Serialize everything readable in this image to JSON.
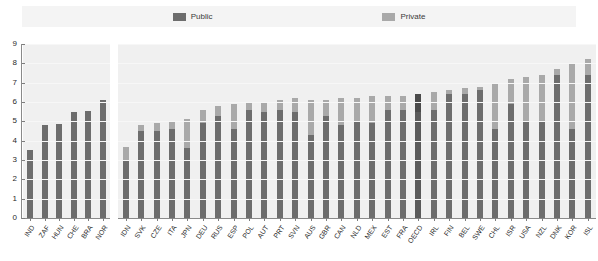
{
  "legend": {
    "entries": [
      {
        "label": "Public",
        "color": "#6d6d6d",
        "icon": "legend-swatch-icon"
      },
      {
        "label": "Private",
        "color": "#a9a9a9",
        "icon": "legend-swatch-icon"
      }
    ]
  },
  "chart_data": {
    "type": "bar",
    "title": "",
    "subtitle": "",
    "xlabel": "",
    "ylabel": "",
    "ylim": [
      0,
      9
    ],
    "yticks": [
      0,
      1,
      2,
      3,
      4,
      5,
      6,
      7,
      8,
      9
    ],
    "ytick_labels": [
      "0",
      "1",
      "2",
      "3",
      "4",
      "5",
      "6",
      "7",
      "8",
      "9"
    ],
    "grid": true,
    "stacked": true,
    "legend_position": "top",
    "legend_entries": [
      "Public",
      "Private"
    ],
    "series": [
      {
        "name": "Public",
        "color": "#6d6d6d"
      },
      {
        "name": "Private",
        "color": "#a9a9a9"
      }
    ],
    "panels": [
      {
        "name": "left-panel",
        "categories": [
          "IND",
          "ZAF",
          "HUN",
          "CHE",
          "BRA",
          "NOR"
        ],
        "public": [
          3.5,
          4.8,
          4.85,
          5.5,
          5.55,
          6.1
        ],
        "private": [
          0.0,
          0.0,
          0.0,
          0.0,
          0.0,
          0.0
        ],
        "totals": [
          3.5,
          4.8,
          4.85,
          5.5,
          5.55,
          6.1
        ],
        "highlight": []
      },
      {
        "name": "right-panel",
        "categories": [
          "IDN",
          "SVK",
          "CZE",
          "ITA",
          "JPN",
          "DEU",
          "RUS",
          "ESP",
          "POL",
          "AUT",
          "PRT",
          "SVN",
          "AUS",
          "GBR",
          "CAN",
          "NLD",
          "MEX",
          "EST",
          "FRA",
          "OECD",
          "IRL",
          "FIN",
          "BEL",
          "SWE",
          "CHL",
          "ISR",
          "USA",
          "NZL",
          "DNK",
          "KOR",
          "ISL"
        ],
        "public": [
          3.0,
          4.5,
          4.5,
          4.6,
          3.6,
          4.9,
          5.3,
          4.6,
          5.6,
          5.5,
          5.6,
          5.5,
          4.3,
          5.3,
          4.8,
          5.0,
          4.9,
          5.6,
          5.6,
          5.5,
          5.6,
          6.4,
          6.4,
          6.6,
          4.6,
          5.9,
          5.0,
          5.0,
          7.4,
          4.6,
          7.4
        ],
        "private": [
          0.65,
          0.3,
          0.4,
          0.4,
          1.5,
          0.7,
          0.5,
          1.3,
          0.4,
          0.5,
          0.5,
          0.7,
          1.8,
          0.8,
          1.4,
          1.2,
          1.4,
          0.7,
          0.7,
          0.9,
          0.9,
          0.2,
          0.3,
          0.2,
          2.4,
          1.3,
          2.3,
          2.4,
          0.3,
          3.4,
          0.8
        ],
        "totals": [
          3.65,
          4.8,
          4.9,
          5.0,
          5.1,
          5.6,
          5.8,
          5.9,
          6.0,
          6.0,
          6.1,
          6.2,
          6.1,
          6.1,
          6.2,
          6.2,
          6.3,
          6.3,
          6.3,
          6.4,
          6.5,
          6.6,
          6.7,
          6.8,
          7.0,
          7.2,
          7.3,
          7.4,
          7.7,
          8.0,
          8.2
        ],
        "highlight": [
          "OECD"
        ]
      }
    ]
  }
}
